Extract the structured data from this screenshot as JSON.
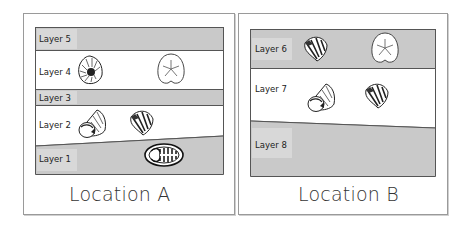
{
  "locations": [
    {
      "label": "Location A",
      "layers": [
        {
          "name": "Layer 5",
          "shade": "gray"
        },
        {
          "name": "Layer 4",
          "shade": "white",
          "fossils": [
            "ammonite",
            "sand-dollar"
          ]
        },
        {
          "name": "Layer 3",
          "shade": "gray"
        },
        {
          "name": "Layer 2",
          "shade": "white",
          "fossils": [
            "snail-gastropod",
            "brachiopod"
          ]
        },
        {
          "name": "Layer 1",
          "shade": "gray",
          "fossils": [
            "trilobite"
          ]
        }
      ]
    },
    {
      "label": "Location B",
      "layers": [
        {
          "name": "Layer 6",
          "shade": "gray",
          "fossils": [
            "brachiopod",
            "sand-dollar"
          ]
        },
        {
          "name": "Layer 7",
          "shade": "white",
          "fossils": [
            "snail-gastropod",
            "brachiopod"
          ]
        },
        {
          "name": "Layer 8",
          "shade": "gray"
        }
      ]
    }
  ],
  "colors": {
    "gray_layer": "#c9c9c9",
    "white_layer": "#ffffff",
    "border": "#555555"
  }
}
